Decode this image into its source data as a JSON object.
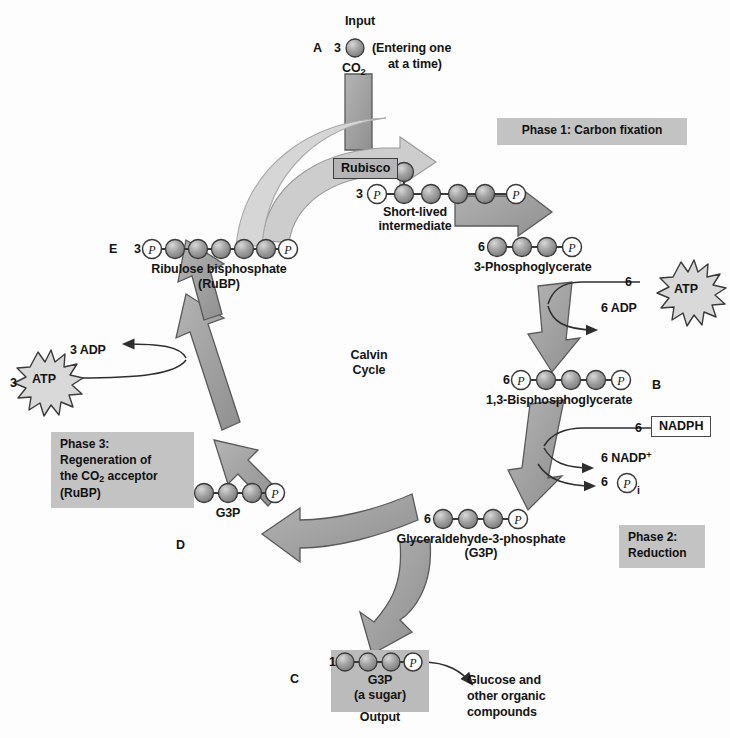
{
  "diagram": {
    "center_label_line1": "Calvin",
    "center_label_line2": "Cycle",
    "colors": {
      "arrow_fill": "#9e9e9e",
      "arrow_stroke": "#4a4a4a",
      "sphere_fill": "#9a9a9a",
      "sphere_stroke": "#3a3a3a",
      "phase_box_bg": "#c3c3c3",
      "background": "#fdfdfd",
      "text": "#141414"
    }
  },
  "input": {
    "marker": "A",
    "title": "Input",
    "count": "3",
    "molecule": "CO",
    "molecule_sub": "2",
    "note_line1": "(Entering one",
    "note_line2": "at a time)"
  },
  "enzyme": {
    "rubisco_label": "Rubisco"
  },
  "phases": [
    {
      "id": "phase1",
      "label": "Phase 1: Carbon fixation"
    },
    {
      "id": "phase2",
      "label_line1": "Phase 2:",
      "label_line2": "Reduction"
    },
    {
      "id": "phase3",
      "label_line1": "Phase 3:",
      "label_line2": "Regeneration of",
      "label_line3a": "the CO",
      "label_line3_sub": "2",
      "label_line3b": " acceptor",
      "label_line4": "(RuBP)"
    }
  ],
  "molecules": [
    {
      "id": "short-lived-intermediate",
      "count": "3",
      "name_line1": "Short-lived",
      "name_line2": "intermediate",
      "carbons": 6,
      "left_phosphate": true,
      "right_phosphate": true,
      "branch_sphere": true
    },
    {
      "id": "3-phosphoglycerate",
      "count": "6",
      "name": "3-Phosphoglycerate",
      "carbons": 3,
      "left_phosphate": false,
      "right_phosphate": true
    },
    {
      "id": "1-3-bisphosphoglycerate",
      "count": "6",
      "name": "1,3-Bisphosphoglycerate",
      "carbons": 3,
      "left_phosphate": true,
      "right_phosphate": true,
      "marker": "B"
    },
    {
      "id": "glyceraldehyde-3-phosphate",
      "count": "6",
      "name_line1": "Glyceraldehyde-3-phosphate",
      "name_line2": "(G3P)",
      "carbons": 3,
      "left_phosphate": false,
      "right_phosphate": true
    },
    {
      "id": "g3p-output",
      "count": "1",
      "name_line1": "G3P",
      "name_line2": "(a sugar)",
      "name_line3": "Output",
      "carbons": 3,
      "left_phosphate": false,
      "right_phosphate": true,
      "marker": "C"
    },
    {
      "id": "g3p-regeneration",
      "count": "5",
      "name": "G3P",
      "carbons": 3,
      "left_phosphate": false,
      "right_phosphate": true,
      "marker": "D"
    },
    {
      "id": "ribulose-bisphosphate",
      "count": "3",
      "name_line1": "Ribulose bisphosphate",
      "name_line2": "(RuBP)",
      "carbons": 5,
      "left_phosphate": true,
      "right_phosphate": true,
      "marker": "E"
    }
  ],
  "energy": {
    "atp_right_count": "6",
    "atp_right_label": "ATP",
    "adp_right": "6 ADP",
    "nadph_count": "6",
    "nadph_label": "NADPH",
    "nadp_plus": "6 NADP",
    "nadp_plus_sup": "+",
    "pi_count": "6",
    "pi_symbol": "P",
    "pi_sub": "i",
    "atp_left_count": "3",
    "atp_left_label": "ATP",
    "adp_left": "3 ADP"
  },
  "output": {
    "products_line1": "Glucose and",
    "products_line2": "other organic",
    "products_line3": "compounds"
  }
}
